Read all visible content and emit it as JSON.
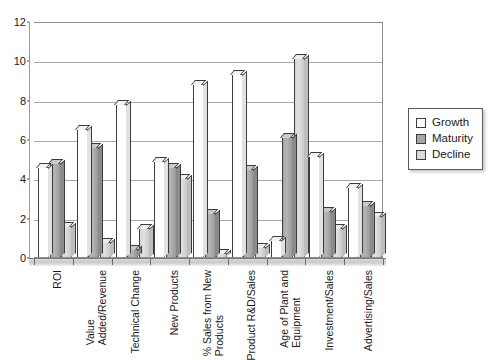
{
  "chart_data": {
    "type": "bar",
    "title": "",
    "subtitle": "",
    "xlabel": "",
    "ylabel": "",
    "ylim": [
      0,
      12
    ],
    "yticks": [
      0,
      2,
      4,
      6,
      8,
      10,
      12
    ],
    "grid": true,
    "legend_position": "right",
    "orientation": "vertical-grouped-3d",
    "categories": [
      "ROI",
      "Value Added/Revenue",
      "Technical Change",
      "New Products",
      "% Sales from New Products",
      "Product R&D/Sales",
      "Age of Plant and Equipment",
      "Investment/Sales",
      "Advertising/Sales"
    ],
    "category_lines": [
      [
        "ROI"
      ],
      [
        "Value",
        "Added/Revenue"
      ],
      [
        "Technical Change"
      ],
      [
        "New Products"
      ],
      [
        "% Sales from New",
        "Products"
      ],
      [
        "Product R&D/Sales"
      ],
      [
        "Age of Plant and",
        "Equipment"
      ],
      [
        "Investment/Sales"
      ],
      [
        "Advertising/Sales"
      ]
    ],
    "series": [
      {
        "name": "Growth",
        "color": "#ffffff",
        "values": [
          4.6,
          6.5,
          7.8,
          4.9,
          8.8,
          9.3,
          0.85,
          5.15,
          3.55
        ]
      },
      {
        "name": "Maturity",
        "color": "#a6a6a6",
        "values": [
          4.8,
          5.6,
          0.4,
          4.6,
          2.25,
          4.45,
          6.1,
          2.35,
          2.65
        ]
      },
      {
        "name": "Decline",
        "color": "#d9d9d9",
        "values": [
          1.6,
          0.75,
          1.5,
          4.0,
          0.2,
          0.5,
          10.1,
          1.45,
          2.1
        ]
      }
    ]
  },
  "legend": {
    "items": [
      {
        "label": "Growth",
        "swatch": "sw-growth"
      },
      {
        "label": "Maturity",
        "swatch": "sw-maturity"
      },
      {
        "label": "Decline",
        "swatch": "sw-decline"
      }
    ]
  },
  "colors": {
    "growth": "#ffffff",
    "maturity": "#a6a6a6",
    "decline": "#d9d9d9",
    "axis": "#8c8c8c",
    "gridline": "#a8a8a8",
    "text": "#1a1a1a"
  }
}
